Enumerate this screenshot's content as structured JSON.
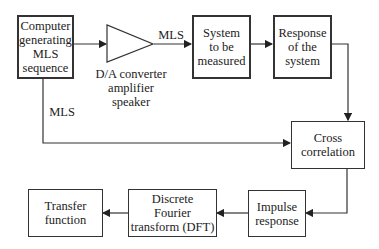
{
  "diagram": {
    "type": "block-flow",
    "nodes": {
      "computer": "Computer\ngenerating\nMLS\nsequence",
      "system": "System\nto be\nmeasured",
      "response": "Response\nof the\nsystem",
      "cross": "Cross\ncorrelation",
      "impulse": "Impulse\nresponse",
      "dft": "Discrete\nFourier\ntransform (DFT)",
      "transfer": "Transfer\nfunction"
    },
    "amplifier_label": "D/A converter\namplifier\nspeaker",
    "edge_labels": {
      "mls_top": "MLS",
      "mls_left": "MLS"
    },
    "edges": [
      {
        "from": "computer",
        "to": "amplifier"
      },
      {
        "from": "amplifier",
        "to": "system",
        "label": "MLS"
      },
      {
        "from": "system",
        "to": "response"
      },
      {
        "from": "response",
        "to": "cross"
      },
      {
        "from": "computer",
        "to": "cross",
        "label": "MLS"
      },
      {
        "from": "cross",
        "to": "impulse"
      },
      {
        "from": "impulse",
        "to": "dft"
      },
      {
        "from": "dft",
        "to": "transfer"
      }
    ]
  }
}
